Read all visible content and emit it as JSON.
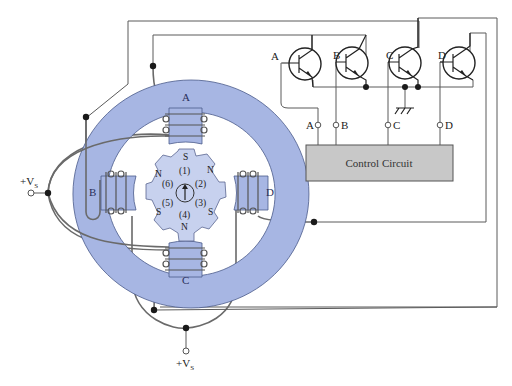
{
  "figure": {
    "type": "stepper-motor-drive-schematic",
    "colors": {
      "stator": "#a7b6e3",
      "rotor": "#c7d1ee",
      "control_box": "#c8c8c8",
      "wire": "#5a5a5a"
    }
  },
  "stator": {
    "coils": [
      {
        "id": "A",
        "label": "A"
      },
      {
        "id": "B",
        "label": "B"
      },
      {
        "id": "C",
        "label": "C"
      },
      {
        "id": "D",
        "label": "D"
      }
    ]
  },
  "rotor": {
    "poles": [
      {
        "pos": "top",
        "label": "S"
      },
      {
        "pos": "upper-right",
        "label": "N"
      },
      {
        "pos": "lower-right",
        "label": "S"
      },
      {
        "pos": "bottom",
        "label": "N"
      },
      {
        "pos": "lower-left",
        "label": "S"
      },
      {
        "pos": "upper-left",
        "label": "N"
      }
    ],
    "tooth_numbers": [
      "(1)",
      "(2)",
      "(3)",
      "(4)",
      "(5)",
      "(6)"
    ],
    "arrow": "up"
  },
  "supply": {
    "left": {
      "label": "+V",
      "subscript": "S"
    },
    "bottom": {
      "label": "+V",
      "subscript": "S"
    }
  },
  "transistors": [
    {
      "id": "A",
      "label": "A"
    },
    {
      "id": "B",
      "label": "B"
    },
    {
      "id": "C",
      "label": "C"
    },
    {
      "id": "D",
      "label": "D"
    }
  ],
  "control_inputs": [
    {
      "id": "A",
      "label": "A"
    },
    {
      "id": "B",
      "label": "B"
    },
    {
      "id": "C",
      "label": "C"
    },
    {
      "id": "D",
      "label": "D"
    }
  ],
  "control_circuit": {
    "label": "Control Circuit"
  },
  "ground": {
    "symbol": "ground-icon"
  }
}
